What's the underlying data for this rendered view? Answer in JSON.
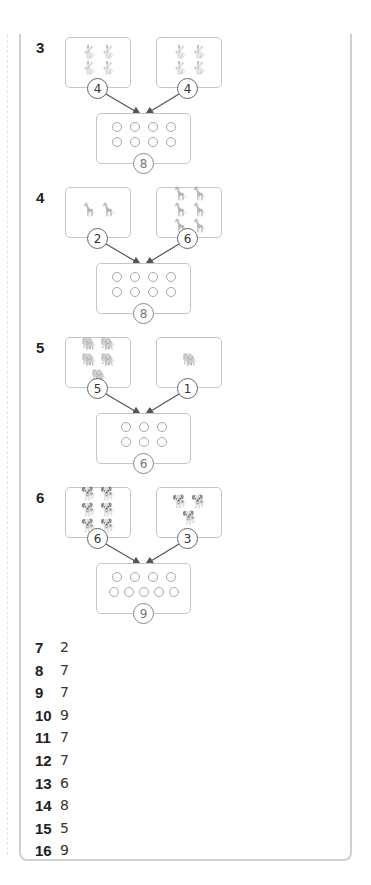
{
  "problems": [
    {
      "number": "3",
      "animal": "rabbit",
      "animal_glyph": "🐇",
      "left": {
        "count": 4,
        "label": "4"
      },
      "right": {
        "count": 4,
        "label": "4"
      },
      "total": {
        "label": "8",
        "dot_rows": [
          4,
          4
        ]
      }
    },
    {
      "number": "4",
      "animal": "giraffe",
      "animal_glyph": "🦒",
      "left": {
        "count": 2,
        "label": "2"
      },
      "right": {
        "count": 6,
        "label": "6"
      },
      "total": {
        "label": "8",
        "dot_rows": [
          4,
          4
        ]
      }
    },
    {
      "number": "5",
      "animal": "elephant",
      "animal_glyph": "🐘",
      "left": {
        "count": 5,
        "label": "5"
      },
      "right": {
        "count": 1,
        "label": "1"
      },
      "total": {
        "label": "6",
        "dot_rows": [
          3,
          3
        ]
      }
    },
    {
      "number": "6",
      "animal": "dog",
      "animal_glyph": "🐕",
      "left": {
        "count": 6,
        "label": "6"
      },
      "right": {
        "count": 3,
        "label": "3"
      },
      "total": {
        "label": "9",
        "dot_rows": [
          4,
          5
        ]
      }
    }
  ],
  "answers": [
    {
      "number": "7",
      "value": "2"
    },
    {
      "number": "8",
      "value": "7"
    },
    {
      "number": "9",
      "value": "7"
    },
    {
      "number": "10",
      "value": "9"
    },
    {
      "number": "11",
      "value": "7"
    },
    {
      "number": "12",
      "value": "7"
    },
    {
      "number": "13",
      "value": "6"
    },
    {
      "number": "14",
      "value": "8"
    },
    {
      "number": "15",
      "value": "5"
    },
    {
      "number": "16",
      "value": "9"
    }
  ],
  "colors": {
    "border": "#cfcfcf",
    "box_border": "#c6c6c6",
    "arrow": "#555555",
    "text": "#222222"
  }
}
